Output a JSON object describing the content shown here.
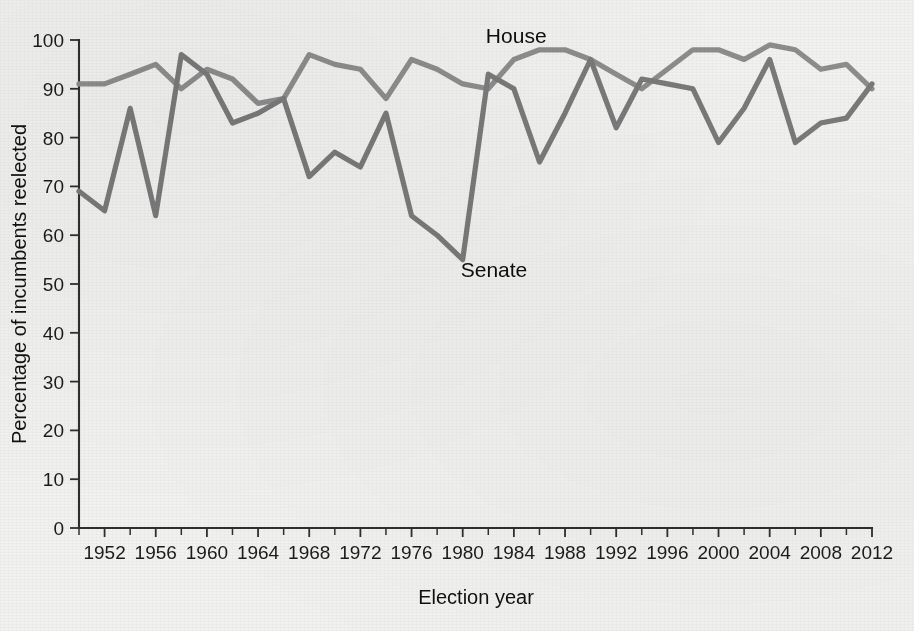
{
  "chart_data": {
    "type": "line",
    "title": "",
    "xlabel": "Election year",
    "ylabel": "Percentage of incumbents reelected",
    "xlim": [
      1950,
      2012
    ],
    "ylim": [
      0,
      100
    ],
    "grid": false,
    "legend_position": "inline-annotation",
    "y_ticks": [
      0,
      10,
      20,
      30,
      40,
      50,
      60,
      70,
      80,
      90,
      100
    ],
    "y_tick_labels": [
      "0",
      "10",
      "20",
      "30",
      "40",
      "50",
      "60",
      "70",
      "80",
      "90",
      "100"
    ],
    "x_ticks": [
      1952,
      1956,
      1960,
      1964,
      1968,
      1972,
      1976,
      1980,
      1984,
      1988,
      1992,
      1996,
      2000,
      2004,
      2008,
      2012
    ],
    "x_tick_labels": [
      "1952",
      "1956",
      "1960",
      "1964",
      "1968",
      "1972",
      "1976",
      "1980",
      "1984",
      "1988",
      "1992",
      "1996",
      "2000",
      "2004",
      "2008",
      "2012"
    ],
    "x_minor_ticks": [
      1950,
      1954,
      1958,
      1962,
      1966,
      1970,
      1974,
      1978,
      1982,
      1986,
      1990,
      1994,
      1998,
      2002,
      2006,
      2010
    ],
    "x": [
      1950,
      1952,
      1954,
      1956,
      1958,
      1960,
      1962,
      1964,
      1966,
      1968,
      1970,
      1972,
      1974,
      1976,
      1978,
      1980,
      1982,
      1984,
      1986,
      1988,
      1990,
      1992,
      1994,
      1996,
      1998,
      2000,
      2002,
      2004,
      2006,
      2008,
      2010,
      2012
    ],
    "series": [
      {
        "name": "House",
        "color": "#8d8d8d",
        "label_x": 1984,
        "label_y": 101,
        "values": [
          91,
          91,
          93,
          95,
          90,
          94,
          92,
          87,
          88,
          97,
          95,
          94,
          88,
          96,
          94,
          91,
          90,
          96,
          98,
          98,
          96,
          93,
          90,
          94,
          98,
          98,
          96,
          99,
          98,
          94,
          95,
          90
        ]
      },
      {
        "name": "Senate",
        "color": "#7a7a7a",
        "label_x": 1980,
        "label_y": 53,
        "values": [
          69,
          65,
          86,
          64,
          97,
          93,
          83,
          85,
          88,
          72,
          77,
          74,
          85,
          64,
          60,
          55,
          93,
          90,
          75,
          85,
          96,
          82,
          92,
          91,
          90,
          79,
          86,
          96,
          79,
          83,
          84,
          91
        ]
      }
    ]
  },
  "annotations": {
    "house_label": "House",
    "senate_label": "Senate"
  }
}
